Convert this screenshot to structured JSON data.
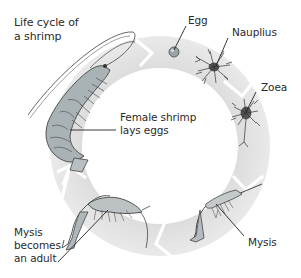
{
  "diagram": {
    "title_line1": "Life cycle of",
    "title_line2": "a shrimp",
    "ring_color": "#e4e4e4",
    "stages": [
      {
        "id": "adult-female",
        "label_line1": "Female shrimp",
        "label_line2": "lays eggs"
      },
      {
        "id": "egg",
        "label_line1": "Egg"
      },
      {
        "id": "nauplius",
        "label_line1": "Nauplius"
      },
      {
        "id": "zoea",
        "label_line1": "Zoea"
      },
      {
        "id": "mysis",
        "label_line1": "Mysis"
      },
      {
        "id": "mysis-to-adult",
        "label_line1": "Mysis",
        "label_line2": "becomes",
        "label_line3": "an adult"
      }
    ],
    "cycle_direction": "clockwise"
  }
}
